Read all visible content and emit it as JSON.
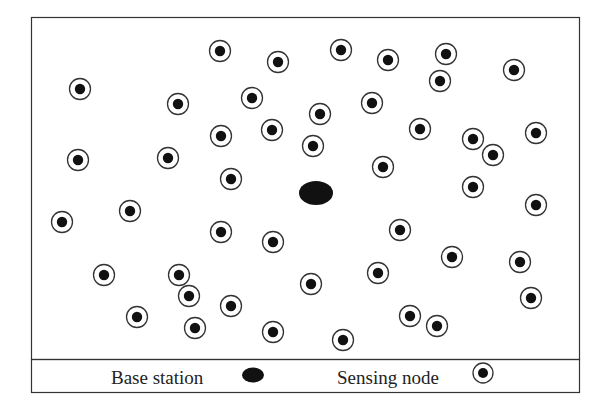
{
  "diagram": {
    "type": "sensor-network-layout",
    "colors": {
      "stroke": "#333333",
      "fill": "#111111",
      "background": "#ffffff"
    },
    "base_station": {
      "label": "Base station",
      "position": [
        316,
        193
      ]
    },
    "sensing_nodes": [
      [
        220,
        51
      ],
      [
        278,
        62
      ],
      [
        341,
        50
      ],
      [
        388,
        60
      ],
      [
        446,
        54
      ],
      [
        440,
        81
      ],
      [
        514,
        70
      ],
      [
        80,
        89
      ],
      [
        178,
        104
      ],
      [
        252,
        98
      ],
      [
        320,
        114
      ],
      [
        372,
        103
      ],
      [
        221,
        136
      ],
      [
        272,
        130
      ],
      [
        313,
        146
      ],
      [
        420,
        129
      ],
      [
        473,
        139
      ],
      [
        493,
        155
      ],
      [
        536,
        133
      ],
      [
        78,
        160
      ],
      [
        168,
        158
      ],
      [
        231,
        179
      ],
      [
        383,
        167
      ],
      [
        473,
        187
      ],
      [
        62,
        222
      ],
      [
        130,
        211
      ],
      [
        536,
        205
      ],
      [
        221,
        232
      ],
      [
        273,
        242
      ],
      [
        400,
        230
      ],
      [
        452,
        257
      ],
      [
        520,
        262
      ],
      [
        104,
        275
      ],
      [
        179,
        275
      ],
      [
        189,
        296
      ],
      [
        311,
        284
      ],
      [
        378,
        273
      ],
      [
        531,
        298
      ],
      [
        231,
        306
      ],
      [
        137,
        317
      ],
      [
        195,
        328
      ],
      [
        273,
        332
      ],
      [
        343,
        340
      ],
      [
        410,
        316
      ],
      [
        437,
        326
      ]
    ]
  },
  "legend": {
    "base_station_label": "Base station",
    "sensing_node_label": "Sensing node"
  }
}
